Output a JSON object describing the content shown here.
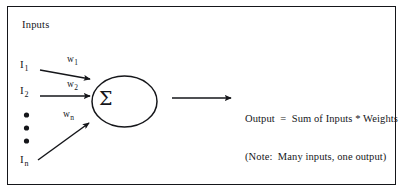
{
  "figure": {
    "background_color": "#ffffff",
    "ink_color": "#15161a",
    "frame": {
      "visible": true,
      "border_color": "#15161a"
    },
    "inputs_heading": "Inputs",
    "summation_symbol": "Σ",
    "inputs": [
      {
        "base": "I",
        "subscript": "1",
        "weight_base": "w",
        "weight_subscript": "1"
      },
      {
        "base": "I",
        "subscript": "2",
        "weight_base": "w",
        "weight_subscript": "2"
      },
      {
        "base": "I",
        "subscript": "n",
        "weight_base": "w",
        "weight_subscript": "n"
      }
    ],
    "ellipsis_dots": 3,
    "output": {
      "line1": "Output  =  Sum of Inputs * Weights",
      "line2": "(Note:  Many inputs, one output)"
    }
  }
}
